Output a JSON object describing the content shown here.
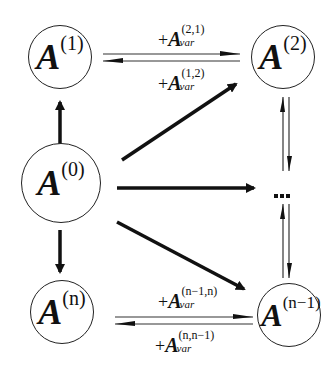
{
  "nodes": {
    "a1": {
      "base": "A",
      "sup": "(1)"
    },
    "a2": {
      "base": "A",
      "sup": "(2)"
    },
    "a0": {
      "base": "A",
      "sup": "(0)"
    },
    "an": {
      "base": "A",
      "sup": "(n)"
    },
    "an1": {
      "base": "A",
      "sup": "(n−1)"
    }
  },
  "edge_labels": {
    "top_forward": {
      "plus": "+",
      "base": "A",
      "sup": "(2,1)",
      "sub": "var"
    },
    "top_backward": {
      "plus": "+",
      "base": "A",
      "sup": "(1,2)",
      "sub": "var"
    },
    "bottom_forward": {
      "plus": "+",
      "base": "A",
      "sup": "(n−1,n)",
      "sub": "var"
    },
    "bottom_backward": {
      "plus": "+",
      "base": "A",
      "sup": "(n,n−1)",
      "sub": "var"
    }
  },
  "ellipsis": "…",
  "colors": {
    "stroke": "#111111",
    "background": "#ffffff"
  }
}
